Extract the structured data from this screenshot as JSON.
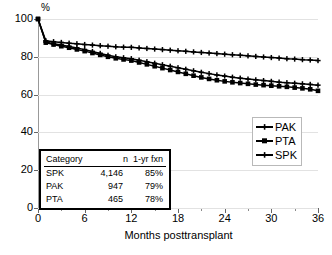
{
  "chart_data": {
    "type": "line",
    "title": "",
    "xlabel": "Months posttransplant",
    "ylabel": "%",
    "unit_label": "%",
    "xlim": [
      0,
      36
    ],
    "ylim": [
      0,
      100
    ],
    "xticks": [
      0,
      6,
      12,
      18,
      24,
      30,
      36
    ],
    "xticklabels": [
      "0",
      "6",
      "12",
      "18",
      "24",
      "30",
      "36"
    ],
    "xminor_step": 3,
    "yticks": [
      0,
      20,
      40,
      60,
      80,
      100
    ],
    "yticklabels": [
      "0",
      "20",
      "40",
      "60",
      "80",
      "100"
    ],
    "grid": "horizontal",
    "legend_position": "center-right",
    "x": [
      0,
      1,
      2,
      3,
      4,
      5,
      6,
      7,
      8,
      9,
      10,
      11,
      12,
      13,
      14,
      15,
      16,
      17,
      18,
      19,
      20,
      21,
      22,
      23,
      24,
      25,
      26,
      27,
      28,
      29,
      30,
      31,
      32,
      33,
      34,
      35,
      36
    ],
    "series": [
      {
        "name": "SPK",
        "marker": "plus",
        "values": [
          100,
          88.5,
          88.0,
          87.6,
          87.2,
          86.9,
          86.5,
          86.2,
          85.9,
          85.6,
          85.3,
          85.1,
          85.0,
          84.7,
          84.4,
          84.1,
          83.8,
          83.5,
          83.2,
          82.9,
          82.6,
          82.3,
          82.0,
          81.7,
          81.4,
          81.1,
          80.8,
          80.5,
          80.2,
          79.9,
          79.6,
          79.3,
          79.0,
          78.8,
          78.5,
          78.3,
          78.0
        ]
      },
      {
        "name": "PAK",
        "marker": "plus",
        "values": [
          100,
          87.8,
          86.9,
          86.2,
          85.5,
          84.7,
          83.8,
          82.8,
          81.8,
          80.8,
          80.0,
          79.5,
          79.0,
          78.2,
          77.4,
          76.6,
          75.8,
          75.0,
          74.2,
          73.4,
          72.6,
          71.8,
          71.1,
          70.4,
          69.8,
          69.2,
          68.7,
          68.2,
          67.8,
          67.4,
          67.0,
          66.6,
          66.3,
          66.0,
          65.7,
          65.4,
          65.0
        ]
      },
      {
        "name": "PTA",
        "marker": "square",
        "values": [
          100,
          87.5,
          86.5,
          85.6,
          84.8,
          83.9,
          83.0,
          82.0,
          81.0,
          80.0,
          79.2,
          78.6,
          78.0,
          77.0,
          76.0,
          75.0,
          74.0,
          73.0,
          72.0,
          71.0,
          70.0,
          69.1,
          68.3,
          67.6,
          67.0,
          66.5,
          66.1,
          65.7,
          65.3,
          65.0,
          64.7,
          64.4,
          64.1,
          63.7,
          63.3,
          62.8,
          62.0
        ]
      }
    ]
  },
  "legend": {
    "items": [
      {
        "label": "PAK",
        "marker": "plus"
      },
      {
        "label": "PTA",
        "marker": "square"
      },
      {
        "label": "SPK",
        "marker": "plus"
      }
    ]
  },
  "summary_table": {
    "headers": [
      "Category",
      "n",
      "1-yr fxn"
    ],
    "rows": [
      {
        "category": "SPK",
        "n": "4,146",
        "fxn": "85%"
      },
      {
        "category": "PAK",
        "n": "947",
        "fxn": "79%"
      },
      {
        "category": "PTA",
        "n": "465",
        "fxn": "78%"
      }
    ]
  },
  "colors": {
    "line": "#000000",
    "grid": "#e2e2e2",
    "axis": "#666666",
    "table_border": "#000000",
    "legend_border": "#b9b9b9"
  }
}
